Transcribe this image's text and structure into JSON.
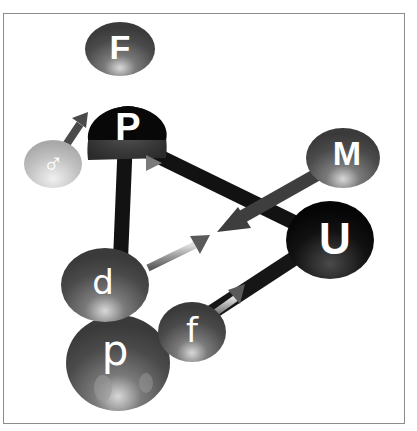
{
  "diagram": {
    "type": "3d-node-graph",
    "nodes": [
      {
        "id": "F",
        "label": "F",
        "shade": "dark-gray"
      },
      {
        "id": "P",
        "label": "P",
        "shade": "black"
      },
      {
        "id": "male",
        "label": "♂",
        "shade": "light-gray"
      },
      {
        "id": "M",
        "label": "M",
        "shade": "dark-gray"
      },
      {
        "id": "U",
        "label": "U",
        "shade": "black"
      },
      {
        "id": "d",
        "label": "d",
        "shade": "dark-gray"
      },
      {
        "id": "p",
        "label": "p",
        "shade": "dark-gray"
      },
      {
        "id": "f",
        "label": "f",
        "shade": "dark-gray"
      }
    ],
    "edges": [
      {
        "from": "P",
        "to": "U",
        "style": "thick-black"
      },
      {
        "from": "P",
        "to": "d",
        "style": "thick-black"
      },
      {
        "from": "U",
        "to": "f",
        "style": "thick-black"
      },
      {
        "from": "male",
        "to": "P",
        "style": "gray-arrow"
      },
      {
        "from": "male",
        "to": "upper-left",
        "style": "dark-arrow"
      },
      {
        "from": "M",
        "to": "center",
        "style": "dark-arrow"
      },
      {
        "from": "d",
        "to": "center",
        "style": "gray-arrow"
      },
      {
        "from": "f",
        "to": "U",
        "style": "gray-arrow"
      }
    ]
  }
}
